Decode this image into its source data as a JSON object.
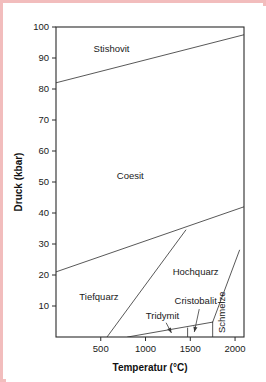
{
  "figure": {
    "border_color": "#f2bdbd",
    "background_color": "#ffffff"
  },
  "chart_data": {
    "type": "line",
    "title": "",
    "xlabel": "Temperatur (°C)",
    "ylabel": "Druck (kbar)",
    "xlim": [
      0,
      2100
    ],
    "ylim": [
      0,
      100
    ],
    "grid": false,
    "legend_position": "none",
    "x_ticks": [
      500,
      1000,
      1500,
      2000
    ],
    "x_tick_labels": [
      "500",
      "1000",
      "1500",
      "2000"
    ],
    "y_ticks": [
      10,
      20,
      30,
      40,
      50,
      60,
      70,
      80,
      90,
      100
    ],
    "y_tick_labels": [
      "10",
      "20",
      "30",
      "40",
      "50",
      "60",
      "70",
      "80",
      "90",
      "100"
    ],
    "region_labels": [
      {
        "name": "Stishovit",
        "text": "Stishovit",
        "x": 620,
        "y": 92,
        "rotation": 0
      },
      {
        "name": "Coesit",
        "text": "Coesit",
        "x": 830,
        "y": 51,
        "rotation": 0
      },
      {
        "name": "Tiefquarz",
        "text": "Tiefquarz",
        "x": 480,
        "y": 12,
        "rotation": 0
      },
      {
        "name": "Hochquarz",
        "text": "Hochquarz",
        "x": 1560,
        "y": 20,
        "rotation": 0
      },
      {
        "name": "Tridymit",
        "text": "Tridymit",
        "x": 1190,
        "y": 5.8,
        "rotation": 0
      },
      {
        "name": "Cristobalit",
        "text": "Cristobalit",
        "x": 1560,
        "y": 10.5,
        "rotation": 0
      },
      {
        "name": "Schmelze",
        "text": "Schmelze",
        "x": 1890,
        "y": 8,
        "rotation": -90
      }
    ],
    "series": [
      {
        "name": "stishovit-coesit-boundary",
        "points": [
          [
            0,
            82
          ],
          [
            2100,
            97.5
          ]
        ]
      },
      {
        "name": "coesit-quarz-boundary",
        "points": [
          [
            0,
            21
          ],
          [
            2100,
            42
          ]
        ]
      },
      {
        "name": "tiefquarz-hochquarz-boundary",
        "points": [
          [
            570,
            0
          ],
          [
            1450,
            34.5
          ]
        ]
      },
      {
        "name": "hochquarz-schmelze-boundary",
        "points": [
          [
            1750,
            4.8
          ],
          [
            2050,
            28
          ]
        ]
      },
      {
        "name": "hochquarz-tridymit-cristobalit-boundary",
        "points": [
          [
            800,
            0
          ],
          [
            1750,
            4.8
          ]
        ]
      },
      {
        "name": "tridymit-cristobalit-divider",
        "points": [
          [
            1470,
            2.9
          ],
          [
            1470,
            0
          ]
        ]
      },
      {
        "name": "cristobalit-schmelze-divider",
        "points": [
          [
            1750,
            4.8
          ],
          [
            1750,
            0
          ]
        ]
      }
    ],
    "annotations": [
      {
        "name": "tridymit-leader",
        "label": "Tridymit",
        "from": [
          1230,
          4.6
        ],
        "to": [
          1290,
          1.3
        ]
      },
      {
        "name": "cristobalit-leader",
        "label": "Cristobalit",
        "from": [
          1600,
          9.0
        ],
        "to": [
          1545,
          1.6
        ]
      }
    ]
  }
}
